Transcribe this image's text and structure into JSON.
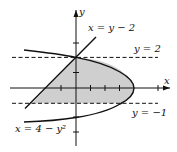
{
  "diagram": {
    "axes": {
      "x_label": "x",
      "y_label": "y"
    },
    "curves": [
      {
        "name": "line",
        "label": "x = y − 2"
      },
      {
        "name": "parabola",
        "label": "x = 4 − y²"
      }
    ],
    "bounds": [
      {
        "name": "upper",
        "label": "y = 2"
      },
      {
        "name": "lower",
        "label": "y = −1"
      }
    ],
    "region": "shaded region between x = y − 2 and x = 4 − y² for −1 ≤ y ≤ 2",
    "colors": {
      "shade": "#cfcfcf",
      "stroke": "#111111"
    }
  }
}
